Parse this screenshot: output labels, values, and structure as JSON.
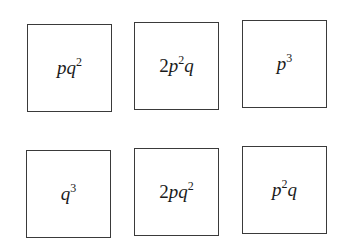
{
  "rows": [
    {
      "boxes": [
        {
          "label": "pq^2",
          "parts": [
            {
              "t": "p",
              "i": true
            },
            {
              "t": "q",
              "i": true
            },
            {
              "t": "2",
              "sup": true
            }
          ],
          "x": 27,
          "y": 24
        },
        {
          "label": "2p^2q",
          "parts": [
            {
              "t": "2",
              "i": false
            },
            {
              "t": "p",
              "i": true
            },
            {
              "t": "2",
              "sup": true
            },
            {
              "t": "q",
              "i": true
            }
          ],
          "x": 134,
          "y": 22
        },
        {
          "label": "p^3",
          "parts": [
            {
              "t": "p",
              "i": true
            },
            {
              "t": "3",
              "sup": true
            }
          ],
          "x": 242,
          "y": 20
        }
      ]
    },
    {
      "boxes": [
        {
          "label": "q^3",
          "parts": [
            {
              "t": "q",
              "i": true
            },
            {
              "t": "3",
              "sup": true
            }
          ],
          "x": 26,
          "y": 150
        },
        {
          "label": "2pq^2",
          "parts": [
            {
              "t": "2",
              "i": false
            },
            {
              "t": "p",
              "i": true
            },
            {
              "t": "q",
              "i": true
            },
            {
              "t": "2",
              "sup": true
            }
          ],
          "x": 134,
          "y": 148
        },
        {
          "label": "p^2q",
          "parts": [
            {
              "t": "p",
              "i": true
            },
            {
              "t": "2",
              "sup": true
            },
            {
              "t": "q",
              "i": true
            }
          ],
          "x": 242,
          "y": 146
        }
      ]
    }
  ],
  "colors": {
    "border": "#3a3a3a",
    "text": "#1a1a1a",
    "background": "#ffffff"
  }
}
